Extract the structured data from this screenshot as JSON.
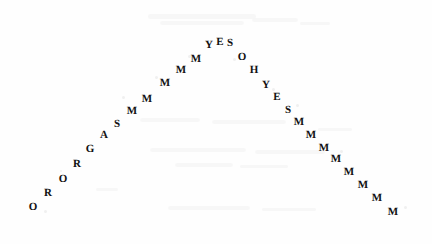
{
  "image": {
    "kind": "scanned-comic-panel",
    "background_color": "#fefefe",
    "ink_color": "#121212",
    "width": 432,
    "height": 244
  },
  "arc": {
    "name": "shouted-dialogue-arc",
    "full_text": "ORORGASMMMMMYESOHYESMMMMMMMMMMMMMM",
    "words": [
      "ORORGASMMMMM",
      "YES",
      "OH",
      "YES",
      "MMMMMMMMMMMMMM"
    ],
    "letters": [
      {
        "char": "O",
        "x": 33,
        "y": 207,
        "size": 11,
        "rot": 0
      },
      {
        "char": "R",
        "x": 48,
        "y": 193,
        "size": 11,
        "rot": 0
      },
      {
        "char": "O",
        "x": 63,
        "y": 179,
        "size": 11,
        "rot": 0
      },
      {
        "char": "R",
        "x": 77,
        "y": 164,
        "size": 11,
        "rot": 0
      },
      {
        "char": "G",
        "x": 90,
        "y": 149,
        "size": 11,
        "rot": 0
      },
      {
        "char": "A",
        "x": 104,
        "y": 135,
        "size": 11,
        "rot": 0
      },
      {
        "char": "S",
        "x": 117,
        "y": 124,
        "size": 11,
        "rot": 0
      },
      {
        "char": "M",
        "x": 132,
        "y": 111,
        "size": 11,
        "rot": 0
      },
      {
        "char": "M",
        "x": 147,
        "y": 99,
        "size": 11,
        "rot": 0
      },
      {
        "char": "M",
        "x": 165,
        "y": 83,
        "size": 11,
        "rot": 0
      },
      {
        "char": "M",
        "x": 181,
        "y": 70,
        "size": 11,
        "rot": 0
      },
      {
        "char": "M",
        "x": 196,
        "y": 59,
        "size": 11,
        "rot": 0
      },
      {
        "char": "Y",
        "x": 209,
        "y": 45,
        "size": 11,
        "rot": 0
      },
      {
        "char": "E",
        "x": 220,
        "y": 42,
        "size": 11,
        "rot": 0
      },
      {
        "char": "S",
        "x": 230,
        "y": 43,
        "size": 11,
        "rot": 0
      },
      {
        "char": "O",
        "x": 242,
        "y": 57,
        "size": 11,
        "rot": 0
      },
      {
        "char": "H",
        "x": 254,
        "y": 70,
        "size": 11,
        "rot": 0
      },
      {
        "char": "Y",
        "x": 266,
        "y": 85,
        "size": 11,
        "rot": 0
      },
      {
        "char": "E",
        "x": 277,
        "y": 97,
        "size": 11,
        "rot": 0
      },
      {
        "char": "S",
        "x": 288,
        "y": 110,
        "size": 11,
        "rot": 0
      },
      {
        "char": "M",
        "x": 299,
        "y": 122,
        "size": 11,
        "rot": 0
      },
      {
        "char": "M",
        "x": 311,
        "y": 135,
        "size": 11,
        "rot": 0
      },
      {
        "char": "M",
        "x": 324,
        "y": 148,
        "size": 11,
        "rot": 0
      },
      {
        "char": "M",
        "x": 336,
        "y": 159,
        "size": 11,
        "rot": 0
      },
      {
        "char": "M",
        "x": 349,
        "y": 172,
        "size": 11,
        "rot": 0
      },
      {
        "char": "M",
        "x": 363,
        "y": 185,
        "size": 11,
        "rot": 0
      },
      {
        "char": "M",
        "x": 377,
        "y": 198,
        "size": 11,
        "rot": 0
      },
      {
        "char": "M",
        "x": 393,
        "y": 212,
        "size": 11,
        "rot": 0
      }
    ]
  },
  "ghosting": {
    "bands": [
      {
        "x": 148,
        "y": 14,
        "w": 108,
        "h": 5
      },
      {
        "x": 160,
        "y": 21,
        "w": 84,
        "h": 4
      },
      {
        "x": 252,
        "y": 18,
        "w": 46,
        "h": 4
      },
      {
        "x": 300,
        "y": 22,
        "w": 30,
        "h": 3
      },
      {
        "x": 140,
        "y": 118,
        "w": 60,
        "h": 4
      },
      {
        "x": 212,
        "y": 120,
        "w": 74,
        "h": 4
      },
      {
        "x": 150,
        "y": 148,
        "w": 96,
        "h": 4
      },
      {
        "x": 255,
        "y": 150,
        "w": 70,
        "h": 4
      },
      {
        "x": 175,
        "y": 163,
        "w": 58,
        "h": 4
      },
      {
        "x": 240,
        "y": 165,
        "w": 48,
        "h": 3
      },
      {
        "x": 168,
        "y": 206,
        "w": 82,
        "h": 4
      },
      {
        "x": 262,
        "y": 208,
        "w": 54,
        "h": 3
      },
      {
        "x": 96,
        "y": 188,
        "w": 22,
        "h": 3
      },
      {
        "x": 318,
        "y": 128,
        "w": 34,
        "h": 3
      }
    ],
    "specks": [
      {
        "x": 44,
        "y": 210,
        "d": 3
      },
      {
        "x": 122,
        "y": 96,
        "d": 3
      },
      {
        "x": 155,
        "y": 76,
        "d": 3
      },
      {
        "x": 188,
        "y": 55,
        "d": 3
      },
      {
        "x": 233,
        "y": 58,
        "d": 3
      },
      {
        "x": 272,
        "y": 88,
        "d": 3
      },
      {
        "x": 296,
        "y": 104,
        "d": 3
      },
      {
        "x": 340,
        "y": 150,
        "d": 3
      },
      {
        "x": 404,
        "y": 206,
        "d": 3
      },
      {
        "x": 60,
        "y": 170,
        "d": 2
      }
    ]
  }
}
